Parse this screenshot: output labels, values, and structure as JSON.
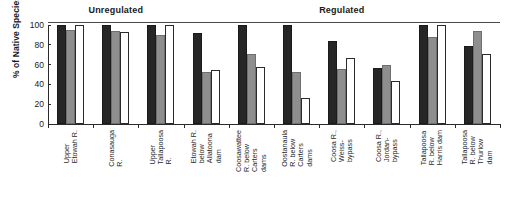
{
  "chart_data": {
    "type": "bar",
    "title": "",
    "xlabel": "",
    "ylabel": "% of Native Species",
    "ylim": [
      0,
      100
    ],
    "yticks": [
      0,
      20,
      40,
      60,
      80,
      100
    ],
    "grid": false,
    "legend_position": "none",
    "group_headers": [
      {
        "label": "Unregulated",
        "start_index": 0,
        "end_index": 2
      },
      {
        "label": "Regulated",
        "start_index": 3,
        "end_index": 9
      }
    ],
    "categories": [
      "Upper Etowah R.",
      "Conasauga R.",
      "Upper Tallapoosa R.",
      "Etowah R. below Allatoona dam",
      "Coosawattee R. below Carters dams",
      "Oostanaula R. below Carters dams",
      "Coosa R., Weiss-bypass",
      "Coosa R., Jordan-bypass",
      "Tallapoosa R. below Harris dam",
      "Tallapoosa R. below Thurlow dam"
    ],
    "category_lines": [
      [
        "Upper",
        "Etowah R."
      ],
      [
        "Conasauga",
        "R."
      ],
      [
        "Upper",
        "Tallapoosa",
        "R."
      ],
      [
        "Etowah R.",
        "below",
        "Allatoona",
        "dam"
      ],
      [
        "Coosawattee",
        "R. below",
        "Carters",
        "dams"
      ],
      [
        "Oostanaula",
        "R. below",
        "Carters",
        "dams"
      ],
      [
        "Coosa R.,",
        "Weiss-",
        "bypass"
      ],
      [
        "Coosa R.,",
        "Jordan-",
        "bypass"
      ],
      [
        "Tallapoosa",
        "R. below",
        "Harris dam"
      ],
      [
        "Tallapoosa",
        "R. below",
        "Thurlow",
        "dam"
      ]
    ],
    "series": [
      {
        "name": "series-1",
        "color": "#262626",
        "style": "dark",
        "values": [
          100,
          100,
          100,
          92,
          100,
          100,
          84,
          57,
          100,
          79
        ]
      },
      {
        "name": "series-2",
        "color": "#8e8e8e",
        "style": "gray",
        "values": [
          95,
          94,
          90,
          53,
          71,
          53,
          56,
          60,
          88,
          94
        ]
      },
      {
        "name": "series-3",
        "color": "#ffffff",
        "style": "white",
        "values": [
          100,
          93,
          100,
          55,
          58,
          26,
          67,
          43,
          100,
          71
        ]
      }
    ]
  }
}
